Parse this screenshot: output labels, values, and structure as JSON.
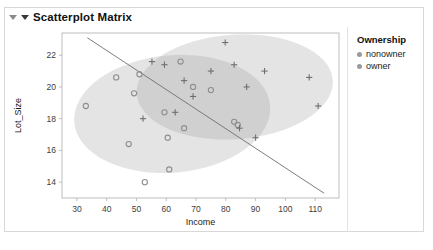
{
  "panel": {
    "title": "Scatterplot Matrix",
    "collapse_icon": "triangle-down-icon",
    "menu_icon": "triangle-down-icon"
  },
  "legend": {
    "title": "Ownership",
    "items": [
      {
        "label": "nonowner",
        "marker": "circle",
        "color": "#9a9a9a"
      },
      {
        "label": "owner",
        "marker": "circle",
        "color": "#9a9a9a"
      }
    ]
  },
  "chart_data": {
    "type": "scatter",
    "title": "Scatterplot Matrix",
    "xlabel": "Income",
    "ylabel": "Lot_Size",
    "xlim": [
      25,
      118
    ],
    "ylim": [
      13.0,
      23.4
    ],
    "xticks": [
      30,
      40,
      50,
      60,
      70,
      80,
      90,
      100,
      110
    ],
    "yticks": [
      14,
      16,
      18,
      20,
      22
    ],
    "grid": false,
    "legend_position": "right",
    "series": [
      {
        "name": "nonowner",
        "marker": "circle",
        "color": "#8e8e8e",
        "points": [
          [
            33.0,
            18.8
          ],
          [
            43.2,
            20.6
          ],
          [
            51.0,
            20.8
          ],
          [
            52.8,
            14.0
          ],
          [
            59.4,
            18.4
          ],
          [
            60.5,
            16.8
          ],
          [
            61.0,
            14.8
          ],
          [
            64.8,
            21.6
          ],
          [
            66.0,
            17.4
          ],
          [
            69.0,
            20.0
          ],
          [
            75.0,
            19.8
          ],
          [
            82.8,
            17.8
          ],
          [
            84.0,
            17.6
          ],
          [
            47.4,
            16.4
          ],
          [
            49.2,
            19.6
          ]
        ]
      },
      {
        "name": "owner",
        "marker": "cross",
        "color": "#6f6f6f",
        "points": [
          [
            59.4,
            21.4
          ],
          [
            63.0,
            18.4
          ],
          [
            66.0,
            20.4
          ],
          [
            69.0,
            19.4
          ],
          [
            75.0,
            21.0
          ],
          [
            79.8,
            22.8
          ],
          [
            82.8,
            21.4
          ],
          [
            84.6,
            17.4
          ],
          [
            87.0,
            20.0
          ],
          [
            90.0,
            16.8
          ],
          [
            93.0,
            21.0
          ],
          [
            108.0,
            20.6
          ],
          [
            111.0,
            18.8
          ],
          [
            55.2,
            21.6
          ],
          [
            52.2,
            18.0
          ]
        ]
      }
    ],
    "ellipses": [
      {
        "name": "nonowner-ellipse",
        "cx": 62.0,
        "cy": 18.3,
        "rx": 33.0,
        "ry": 3.7,
        "rotation": -5,
        "fill": "#9b9b9b",
        "opacity": 0.27
      },
      {
        "name": "owner-ellipse",
        "cx": 83.0,
        "cy": 20.0,
        "rx": 33.0,
        "ry": 3.3,
        "rotation": -4,
        "fill": "#9b9b9b",
        "opacity": 0.27
      }
    ],
    "line": {
      "name": "separating-line",
      "x0": 33.5,
      "y0": 23.1,
      "x1": 113.0,
      "y1": 13.3,
      "color": "#6e6e6e"
    }
  }
}
